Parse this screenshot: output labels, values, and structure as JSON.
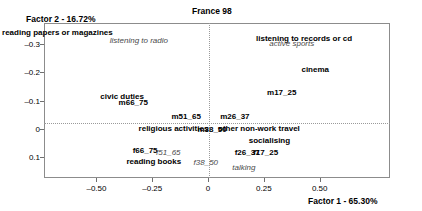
{
  "chart_data": {
    "type": "scatter",
    "title": "France 98",
    "xlabel": "Factor 1 - 65.30%",
    "ylabel": "Factor 2 - 16.72%",
    "xlim": [
      -0.735,
      0.815
    ],
    "ylim": [
      -0.375,
      0.175
    ],
    "y_axis_inverted": true,
    "grid": false,
    "legend": "none",
    "xticks": [
      -0.5,
      -0.25,
      0,
      0.25,
      0.5
    ],
    "xticklabels": [
      "–0.50",
      "–0.25",
      "0",
      "0.25",
      "0.50"
    ],
    "yticks": [
      -0.3,
      -0.2,
      -0.1,
      0,
      0.1
    ],
    "yticklabels": [
      "–0.3",
      "–0.2",
      "–0.1",
      "0",
      "0.1"
    ],
    "reference_lines": {
      "x": 0,
      "y": 0,
      "style": "dotted"
    },
    "series": [
      {
        "name": "activities",
        "style": "bold",
        "points": [
          {
            "label": "reading papers or magazines",
            "x": -0.675,
            "y": -0.338
          },
          {
            "label": "listening to records or cd",
            "x": 0.43,
            "y": -0.318
          },
          {
            "label": "cinema",
            "x": 0.48,
            "y": -0.21
          },
          {
            "label": "civic duties",
            "x": -0.385,
            "y": -0.112
          },
          {
            "label": "religious activities",
            "x": -0.155,
            "y": 0.0
          },
          {
            "label": "other non-work travel",
            "x": 0.228,
            "y": 0.0
          },
          {
            "label": "socialising",
            "x": 0.275,
            "y": 0.042
          },
          {
            "label": "reading books",
            "x": -0.243,
            "y": 0.118
          }
        ]
      },
      {
        "name": "activities-italic",
        "style": "italic",
        "points": [
          {
            "label": "listening to radio",
            "x": -0.31,
            "y": -0.312
          },
          {
            "label": "active sports",
            "x": 0.375,
            "y": -0.3
          },
          {
            "label": "talking",
            "x": 0.16,
            "y": 0.14
          }
        ]
      },
      {
        "name": "men-age-groups",
        "style": "bold",
        "points": [
          {
            "label": "m66_75",
            "x": -0.335,
            "y": -0.09
          },
          {
            "label": "m51_65",
            "x": -0.098,
            "y": -0.042
          },
          {
            "label": "m38_50",
            "x": 0.018,
            "y": 0.004
          },
          {
            "label": "m26_37",
            "x": 0.12,
            "y": -0.04
          },
          {
            "label": "m17_25",
            "x": 0.33,
            "y": -0.128
          }
        ]
      },
      {
        "name": "women-age-groups-bold",
        "style": "bold",
        "points": [
          {
            "label": "f66_75",
            "x": -0.282,
            "y": 0.078
          },
          {
            "label": "f26_37",
            "x": 0.175,
            "y": 0.085
          },
          {
            "label": "f17_25",
            "x": 0.258,
            "y": 0.085
          }
        ]
      },
      {
        "name": "women-age-groups-italic",
        "style": "italic",
        "points": [
          {
            "label": "f51_65",
            "x": -0.178,
            "y": 0.085
          },
          {
            "label": "f38_50",
            "x": -0.01,
            "y": 0.122
          }
        ]
      }
    ]
  },
  "colors": {
    "frame": "#8c8c8c",
    "reference_line": "#9a9a9a",
    "text": "#000000",
    "italic_text": "#4a4a4a",
    "background": "#ffffff"
  }
}
